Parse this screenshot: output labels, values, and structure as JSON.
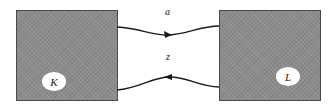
{
  "diagram": {
    "nodes": [
      {
        "id": "K",
        "label": "K",
        "color": "#8c8c8c"
      },
      {
        "id": "L",
        "label": "L",
        "color": "#8c8c8c"
      }
    ],
    "edges": [
      {
        "from": "K",
        "to": "L",
        "label": "a"
      },
      {
        "from": "L",
        "to": "K",
        "label": "z"
      }
    ]
  }
}
